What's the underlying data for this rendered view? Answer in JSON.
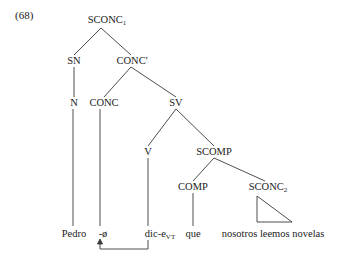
{
  "example_number": "(68)",
  "nodes": {
    "sconc1": {
      "label": "SCONC",
      "sub": "1"
    },
    "sn": {
      "label": "SN"
    },
    "conc_bar": {
      "label": "CONC'"
    },
    "n": {
      "label": "N"
    },
    "conc": {
      "label": "CONC"
    },
    "sv": {
      "label": "SV"
    },
    "v": {
      "label": "V"
    },
    "scomp": {
      "label": "SCOMP"
    },
    "comp": {
      "label": "COMP"
    },
    "sconc2": {
      "label": "SCONC",
      "sub": "2"
    }
  },
  "leaves": {
    "pedro": "Pedro",
    "null_conc": "-ø",
    "dice": {
      "text": "dic-e",
      "sub": "VT"
    },
    "que": "que",
    "clause": "nosotros leemos novelas"
  },
  "movement_arrow": {
    "from": "dic-e",
    "to": "-ø"
  }
}
